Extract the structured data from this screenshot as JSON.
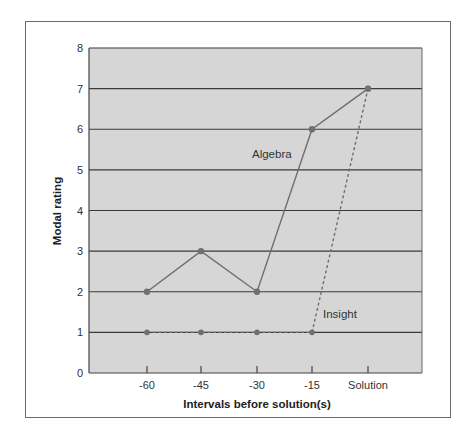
{
  "chart_data": {
    "type": "line",
    "title": "",
    "xlabel": "Intervals before solution(s)",
    "ylabel": "Modal rating",
    "categories": [
      "-60",
      "-45",
      "-30",
      "-15",
      "Solution"
    ],
    "ylim": [
      0,
      8
    ],
    "yticks": [
      "0",
      "1",
      "2",
      "3",
      "4",
      "5",
      "6",
      "7",
      "8"
    ],
    "grid": "horizontal",
    "legend": "inline labels",
    "series": [
      {
        "name": "Algebra",
        "values": [
          2,
          3,
          2,
          6,
          7
        ],
        "style": "solid"
      },
      {
        "name": "Insight",
        "values": [
          1,
          1,
          1,
          1,
          7
        ],
        "style": "dashed"
      }
    ],
    "colors": {
      "plot_background": "#d6d6d6",
      "gridline": "#3a3a3a",
      "line": "#6e6e6e",
      "marker": "#707070"
    }
  }
}
